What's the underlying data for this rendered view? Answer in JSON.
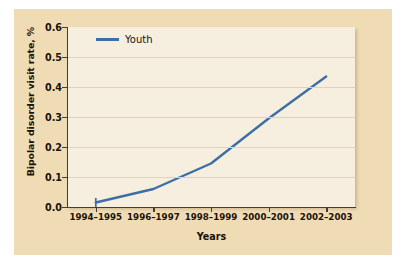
{
  "chart_data": {
    "type": "line",
    "title": "",
    "xlabel": "Years",
    "ylabel": "Bipolar disorder visit rate, %",
    "categories": [
      "1994–1995",
      "1996–1997",
      "1998–1999",
      "2000–2001",
      "2002–2003"
    ],
    "series": [
      {
        "name": "Youth",
        "values": [
          0.015,
          0.06,
          0.145,
          0.295,
          0.435
        ],
        "color": "#3d6fa5"
      }
    ],
    "ylim": [
      0.0,
      0.6
    ],
    "yticks": [
      0.0,
      0.1,
      0.2,
      0.3,
      0.4,
      0.5,
      0.6
    ],
    "ytick_labels": [
      "0.0",
      "0.1",
      "0.2",
      "0.3",
      "0.4",
      "0.5",
      "0.6"
    ],
    "grid": true,
    "grid_axis": "y",
    "legend_position": "top-left",
    "legend_entries": [
      "Youth"
    ]
  },
  "style": {
    "panel_background": "#f0dcb4",
    "plot_background": "#f6efe0",
    "axis_color": "#4a3c26",
    "gridline_color": "#ded2bb",
    "text_color": "#1a1008",
    "series_color": "#3d6fa5"
  }
}
